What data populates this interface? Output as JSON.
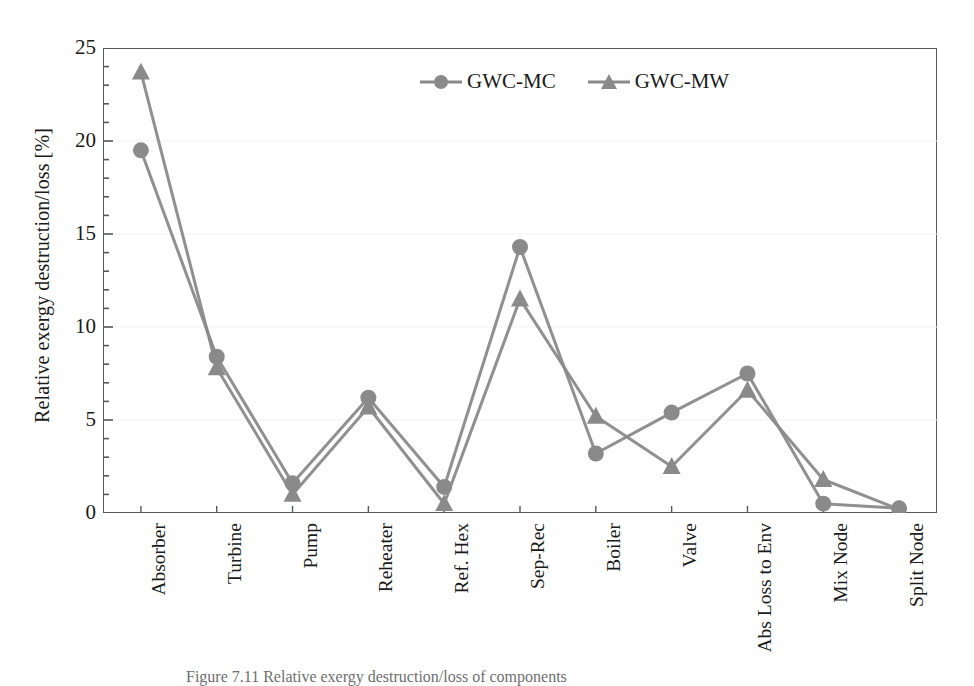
{
  "figure": {
    "background": "#ffffff",
    "caption": "Figure 7.11  Relative exergy destruction/loss of components"
  },
  "chart_data": {
    "type": "line",
    "title": "",
    "xlabel": "",
    "ylabel": "Relative exergy destruction/loss [%]",
    "ylim": [
      0,
      25
    ],
    "ytick_values": [
      0,
      5,
      10,
      15,
      20,
      25
    ],
    "ytick_labels": [
      "0",
      "5",
      "10",
      "15",
      "20",
      "25"
    ],
    "y_minor_tick_step": 1,
    "grid": false,
    "legend_position": "top-center",
    "categories": [
      "Absorber",
      "Turbine",
      "Pump",
      "Reheater",
      "Ref. Hex",
      "Sep-Rec",
      "Boiler",
      "Valve",
      "Abs Loss to Env",
      "Mix Node",
      "Split Node"
    ],
    "series": [
      {
        "name": "GWC-MC",
        "marker": "circle",
        "color": "#8a8a8a",
        "values": [
          19.5,
          8.4,
          1.6,
          6.2,
          1.4,
          14.3,
          3.2,
          5.4,
          7.5,
          0.5,
          0.25
        ]
      },
      {
        "name": "GWC-MW",
        "marker": "triangle",
        "color": "#8a8a8a",
        "values": [
          23.7,
          7.8,
          1.0,
          5.7,
          0.5,
          11.5,
          5.2,
          2.5,
          6.6,
          1.8,
          0.2
        ]
      }
    ]
  },
  "style": {
    "frame_color": "#55585c",
    "line_color": "#8a8a8a",
    "marker_color": "#8a8a8a",
    "text_color": "#1a1a1a"
  }
}
